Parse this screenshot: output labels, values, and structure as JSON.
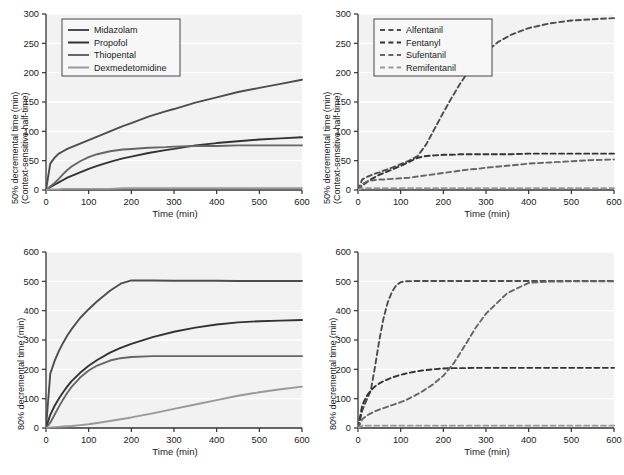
{
  "figure": {
    "width": 624,
    "height": 475,
    "background": "#ffffff",
    "plot_background": "#f2f2f2",
    "gridline_color": "#ffffff",
    "axis_color": "#333333"
  },
  "common": {
    "xlabel": "Time (min)",
    "xticks": [
      0,
      100,
      200,
      300,
      400,
      500,
      600
    ],
    "xlim": [
      0,
      600
    ],
    "ylabel_50_line1": "50% decremental time (min)",
    "ylabel_50_line2": "(Context-sensitive half-time)",
    "ylabel_80": "80% decremental time (min)"
  },
  "series_colors": {
    "midazolam": "#4d4d4d",
    "propofol": "#333333",
    "thiopental": "#666666",
    "dexmedetomidine": "#999999",
    "alfentanil": "#4d4d4d",
    "fentanyl": "#333333",
    "sufentanil": "#666666",
    "remifentanil": "#999999"
  },
  "chart_data": [
    {
      "id": "panel-top-left",
      "type": "line",
      "title": "",
      "xlabel": "Time (min)",
      "ylabel": "50% decremental time (min) (Context-sensitive half-time)",
      "xlim": [
        0,
        600
      ],
      "ylim": [
        0,
        300
      ],
      "xticks": [
        0,
        100,
        200,
        300,
        400,
        500,
        600
      ],
      "yticks": [
        0,
        50,
        100,
        150,
        200,
        250,
        300
      ],
      "grid": "horizontal",
      "legend_position": "upper-left",
      "linestyle": "solid",
      "x": [
        0,
        10,
        20,
        30,
        40,
        50,
        60,
        80,
        100,
        120,
        150,
        180,
        200,
        240,
        280,
        300,
        350,
        400,
        450,
        500,
        550,
        600
      ],
      "series": [
        {
          "name": "Alfentanil_placeholder",
          "label": "Midazolam",
          "color": "#4d4d4d",
          "values": [
            0,
            45,
            55,
            62,
            66,
            70,
            73,
            79,
            85,
            91,
            100,
            109,
            114,
            125,
            134,
            138,
            149,
            158,
            167,
            174,
            181,
            188
          ]
        },
        {
          "label": "Propofol",
          "color": "#333333",
          "values": [
            0,
            5,
            9,
            13,
            17,
            21,
            24,
            30,
            36,
            41,
            48,
            54,
            57,
            63,
            68,
            70,
            76,
            80,
            83,
            86,
            88,
            90
          ]
        },
        {
          "label": "Thiopental",
          "color": "#666666",
          "values": [
            0,
            6,
            12,
            19,
            27,
            34,
            40,
            49,
            56,
            61,
            66,
            69,
            70,
            72,
            73,
            74,
            75,
            75,
            76,
            76,
            76,
            76
          ]
        },
        {
          "label": "Dexmedetomidine",
          "color": "#999999",
          "values": [
            0,
            1,
            1,
            1,
            2,
            2,
            2,
            2,
            2,
            2,
            2,
            3,
            3,
            3,
            3,
            3,
            3,
            3,
            3,
            3,
            3,
            3
          ]
        }
      ]
    },
    {
      "id": "panel-top-right",
      "type": "line",
      "title": "",
      "xlabel": "Time (min)",
      "ylabel": "50% decremental time (min) (Context-sensitive half-time)",
      "xlim": [
        0,
        600
      ],
      "ylim": [
        0,
        300
      ],
      "xticks": [
        0,
        100,
        200,
        300,
        400,
        500,
        600
      ],
      "yticks": [
        0,
        50,
        100,
        150,
        200,
        250,
        300
      ],
      "grid": "horizontal",
      "legend_position": "upper-left",
      "linestyle": "dashed",
      "x": [
        0,
        10,
        20,
        30,
        40,
        50,
        60,
        80,
        100,
        120,
        140,
        160,
        180,
        200,
        220,
        240,
        260,
        280,
        300,
        330,
        360,
        400,
        450,
        500,
        550,
        600
      ],
      "series": [
        {
          "label": "Alfentanil",
          "color": "#4d4d4d",
          "values": [
            0,
            18,
            22,
            25,
            28,
            30,
            33,
            38,
            44,
            50,
            58,
            78,
            105,
            132,
            158,
            182,
            203,
            221,
            236,
            253,
            265,
            276,
            284,
            289,
            291,
            293
          ]
        },
        {
          "label": "Fentanyl",
          "color": "#333333",
          "values": [
            0,
            8,
            13,
            18,
            22,
            26,
            29,
            35,
            41,
            48,
            55,
            58,
            59,
            60,
            60,
            61,
            61,
            61,
            61,
            61,
            61,
            62,
            62,
            62,
            62,
            62
          ]
        },
        {
          "label": "Sufentanil",
          "color": "#666666",
          "values": [
            0,
            10,
            14,
            16,
            17,
            18,
            18,
            19,
            20,
            21,
            23,
            25,
            27,
            29,
            31,
            33,
            35,
            36,
            38,
            40,
            42,
            45,
            47,
            49,
            51,
            52
          ]
        },
        {
          "label": "Remifentanil",
          "color": "#999999",
          "values": [
            0,
            3,
            3,
            3,
            3,
            3,
            3,
            3,
            3,
            3,
            3,
            3,
            3,
            3,
            3,
            3,
            3,
            3,
            3,
            3,
            3,
            3,
            3,
            3,
            3,
            3
          ]
        }
      ]
    },
    {
      "id": "panel-bottom-left",
      "type": "line",
      "title": "",
      "xlabel": "Time (min)",
      "ylabel": "80% decremental time (min)",
      "xlim": [
        0,
        600
      ],
      "ylim": [
        0,
        600
      ],
      "xticks": [
        0,
        100,
        200,
        300,
        400,
        500,
        600
      ],
      "yticks": [
        0,
        100,
        200,
        300,
        400,
        500,
        600
      ],
      "grid": "horizontal",
      "legend_position": "none",
      "linestyle": "solid",
      "x": [
        0,
        10,
        20,
        30,
        40,
        50,
        60,
        80,
        100,
        120,
        150,
        175,
        200,
        250,
        300,
        350,
        400,
        450,
        500,
        550,
        600
      ],
      "series": [
        {
          "label": "Midazolam",
          "color": "#4d4d4d",
          "values": [
            0,
            185,
            228,
            262,
            290,
            315,
            337,
            375,
            405,
            432,
            468,
            492,
            503,
            503,
            502,
            502,
            502,
            501,
            501,
            501,
            501
          ]
        },
        {
          "label": "Propofol",
          "color": "#333333",
          "values": [
            0,
            45,
            75,
            100,
            122,
            142,
            160,
            188,
            212,
            232,
            257,
            273,
            287,
            310,
            328,
            342,
            353,
            360,
            364,
            366,
            368
          ]
        },
        {
          "label": "Thiopental",
          "color": "#666666",
          "values": [
            0,
            18,
            45,
            72,
            97,
            120,
            140,
            172,
            196,
            213,
            230,
            238,
            242,
            245,
            245,
            245,
            245,
            245,
            245,
            245,
            245
          ]
        },
        {
          "label": "Dexmedetomidine",
          "color": "#999999",
          "values": [
            0,
            2,
            3,
            4,
            5,
            6,
            7,
            10,
            13,
            17,
            24,
            30,
            36,
            50,
            65,
            80,
            95,
            110,
            122,
            132,
            141
          ]
        }
      ]
    },
    {
      "id": "panel-bottom-right",
      "type": "line",
      "title": "",
      "xlabel": "Time (min)",
      "ylabel": "80% decremental time (min)",
      "xlim": [
        0,
        600
      ],
      "ylim": [
        0,
        600
      ],
      "xticks": [
        0,
        100,
        200,
        300,
        400,
        500,
        600
      ],
      "yticks": [
        0,
        100,
        200,
        300,
        400,
        500,
        600
      ],
      "grid": "horizontal",
      "legend_position": "none",
      "linestyle": "dashed",
      "x": [
        0,
        10,
        20,
        30,
        40,
        50,
        60,
        70,
        80,
        90,
        100,
        110,
        130,
        150,
        175,
        200,
        225,
        250,
        275,
        300,
        350,
        400,
        450,
        500,
        550,
        600
      ],
      "series": [
        {
          "label": "Alfentanil",
          "color": "#4d4d4d",
          "values": [
            0,
            60,
            95,
            128,
            210,
            300,
            375,
            430,
            465,
            487,
            497,
            500,
            501,
            501,
            501,
            501,
            501,
            501,
            501,
            501,
            501,
            501,
            501,
            501,
            501,
            501
          ]
        },
        {
          "label": "Fentanyl",
          "color": "#333333",
          "values": [
            0,
            78,
            108,
            128,
            142,
            152,
            160,
            166,
            172,
            177,
            181,
            185,
            191,
            196,
            200,
            203,
            204,
            204,
            205,
            205,
            205,
            205,
            205,
            205,
            205,
            205
          ]
        },
        {
          "label": "Sufentanil",
          "color": "#666666",
          "values": [
            0,
            30,
            42,
            50,
            57,
            63,
            68,
            73,
            78,
            83,
            88,
            94,
            108,
            124,
            148,
            178,
            222,
            280,
            340,
            390,
            460,
            495,
            499,
            500,
            500,
            500
          ]
        },
        {
          "label": "Remifentanil",
          "color": "#999999",
          "values": [
            0,
            8,
            8,
            8,
            8,
            8,
            8,
            8,
            8,
            8,
            8,
            8,
            8,
            8,
            8,
            8,
            8,
            8,
            8,
            8,
            8,
            8,
            8,
            8,
            8,
            8
          ]
        }
      ]
    }
  ]
}
